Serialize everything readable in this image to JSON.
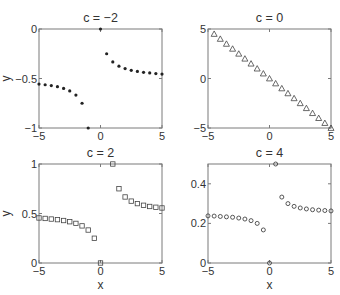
{
  "figure": {
    "width": 340,
    "height": 295,
    "background": "#ffffff",
    "axis_color": "#7a7a7a",
    "text_color": "#333333",
    "marker_color": "#444444"
  },
  "chart_data": [
    {
      "type": "scatter",
      "title": "c = −2",
      "c": -2,
      "xlabel": "",
      "ylabel": "y",
      "xlim": [
        -5,
        5
      ],
      "ylim": [
        -1,
        0
      ],
      "xticks": [
        -5,
        0,
        5
      ],
      "xticklabels": [
        "−5",
        "0",
        "5"
      ],
      "yticks": [
        -1,
        -0.5,
        0
      ],
      "yticklabels": [
        "−1",
        "−0.5",
        "0"
      ],
      "marker": "asterisk",
      "box": {
        "x0": 39,
        "x1": 162,
        "y0": 29,
        "y1": 128
      },
      "x": [
        -5,
        -4.5,
        -4,
        -3.5,
        -3,
        -2.5,
        -2,
        -1.5,
        -1,
        0,
        0.5,
        1,
        1.5,
        2,
        2.5,
        3,
        3.5,
        4,
        4.5,
        5
      ],
      "y": [
        -0.556,
        -0.563,
        -0.571,
        -0.583,
        -0.6,
        -0.625,
        -0.667,
        -0.75,
        -1.0,
        0,
        -0.25,
        -0.333,
        -0.375,
        -0.4,
        -0.417,
        -0.429,
        -0.438,
        -0.444,
        -0.45,
        -0.455
      ]
    },
    {
      "type": "scatter",
      "title": "c = 0",
      "c": 0,
      "xlabel": "",
      "ylabel": "",
      "xlim": [
        -5,
        5
      ],
      "ylim": [
        -5,
        5
      ],
      "xticks": [
        -5,
        0,
        5
      ],
      "xticklabels": [
        "−5",
        "0",
        "5"
      ],
      "yticks": [
        -5,
        0,
        5
      ],
      "yticklabels": [
        "−5",
        "0",
        "5"
      ],
      "marker": "triangle",
      "box": {
        "x0": 208,
        "x1": 331,
        "y0": 29,
        "y1": 128
      },
      "x": [
        -4.5,
        -4,
        -3.5,
        -3,
        -2.5,
        -2,
        -1.5,
        -1,
        -0.5,
        0,
        0.5,
        1,
        1.5,
        2,
        2.5,
        3,
        3.5,
        4,
        4.5,
        5
      ],
      "y": [
        4.5,
        4,
        3.5,
        3,
        2.5,
        2,
        1.5,
        1,
        0.5,
        0,
        -0.5,
        -1,
        -1.5,
        -2,
        -2.5,
        -3,
        -3.5,
        -4,
        -4.5,
        -5
      ]
    },
    {
      "type": "scatter",
      "title": "c = 2",
      "c": 2,
      "xlabel": "x",
      "ylabel": "y",
      "xlim": [
        -5,
        5
      ],
      "ylim": [
        0,
        1
      ],
      "xticks": [
        -5,
        0,
        5
      ],
      "xticklabels": [
        "−5",
        "0",
        "5"
      ],
      "yticks": [
        0,
        0.5,
        1
      ],
      "yticklabels": [
        "0",
        "0.5",
        "1"
      ],
      "marker": "square",
      "box": {
        "x0": 39,
        "x1": 162,
        "y0": 164,
        "y1": 263
      },
      "x": [
        -5,
        -4.5,
        -4,
        -3.5,
        -3,
        -2.5,
        -2,
        -1.5,
        -1,
        -0.5,
        0,
        1,
        1.5,
        2,
        2.5,
        3,
        3.5,
        4,
        4.5,
        5
      ],
      "y": [
        0.455,
        0.45,
        0.444,
        0.438,
        0.429,
        0.417,
        0.4,
        0.375,
        0.333,
        0.25,
        0,
        1.0,
        0.75,
        0.667,
        0.625,
        0.6,
        0.583,
        0.571,
        0.563,
        0.556
      ]
    },
    {
      "type": "scatter",
      "title": "c = 4",
      "c": 4,
      "xlabel": "x",
      "ylabel": "",
      "xlim": [
        -5,
        5
      ],
      "ylim": [
        0,
        0.5
      ],
      "xticks": [
        -5,
        0,
        5
      ],
      "xticklabels": [
        "−5",
        "0",
        "5"
      ],
      "yticks": [
        0,
        0.2,
        0.4
      ],
      "yticklabels": [
        "0",
        "0.2",
        "0.4"
      ],
      "marker": "hexagram",
      "box": {
        "x0": 208,
        "x1": 331,
        "y0": 164,
        "y1": 263
      },
      "x": [
        -5,
        -4.5,
        -4,
        -3.5,
        -3,
        -2.5,
        -2,
        -1.5,
        -1,
        -0.5,
        0,
        0.5,
        1,
        1.5,
        2,
        2.5,
        3,
        3.5,
        4,
        4.5,
        5
      ],
      "y": [
        0.238,
        0.237,
        0.235,
        0.233,
        0.231,
        0.227,
        0.222,
        0.214,
        0.2,
        0.167,
        0,
        0.5,
        0.333,
        0.3,
        0.286,
        0.278,
        0.273,
        0.269,
        0.267,
        0.265,
        0.263
      ]
    }
  ]
}
